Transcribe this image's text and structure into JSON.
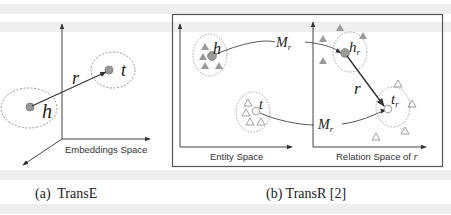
{
  "panel_a": {
    "caption": "(a)  TransE",
    "axis_label": "Embeddings Space",
    "labels": {
      "head": "h",
      "relation": "r",
      "tail": "t"
    }
  },
  "panel_b": {
    "caption": "(b) TransR [2]",
    "entity_space_label": "Entity Space",
    "relation_space_label": "Relation Space of",
    "relation_space_symbol": "r",
    "labels": {
      "head": "h",
      "tail": "t",
      "projection_top": "M",
      "projection_top_sub": "r",
      "projection_bottom": "M",
      "projection_bottom_sub": "r",
      "projected_head": "h",
      "projected_head_sub": "r",
      "projected_tail": "t",
      "projected_tail_sub": "r",
      "relation": "r"
    }
  },
  "colors": {
    "line": "#333333",
    "dotted": "#888888",
    "filled_node": "#999999",
    "filled_triangle": "#9a9a9a",
    "hollow_stroke": "#888888"
  }
}
